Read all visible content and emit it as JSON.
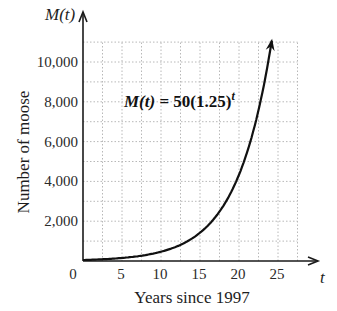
{
  "chart_data": {
    "type": "line",
    "title": "",
    "function_label": "M(t) = 50(1.25)^t",
    "equation": {
      "lhs": "M(t)",
      "eq": " = ",
      "coef": "50(1.25)",
      "exp": "t"
    },
    "xlabel": "Years since 1997",
    "ylabel": "Number of moose",
    "x_axis_symbol": "t",
    "y_axis_symbol": "M(t)",
    "xlim": [
      0,
      28
    ],
    "ylim": [
      0,
      11000
    ],
    "x_ticks": [
      0,
      5,
      10,
      15,
      20,
      25
    ],
    "x_tick_labels": [
      "0",
      "5",
      "10",
      "15",
      "20",
      "25"
    ],
    "y_ticks": [
      2000,
      4000,
      6000,
      8000,
      10000
    ],
    "y_tick_labels": [
      "2,000",
      "4,000",
      "6,000",
      "8,000",
      "10,000"
    ],
    "grid": true,
    "grid_style": "dotted",
    "grid_x_step": 2.5,
    "grid_y_step": 1000,
    "series": [
      {
        "name": "M(t) = 50(1.25)^t",
        "x": [
          0,
          2,
          4,
          6,
          8,
          10,
          12,
          14,
          16,
          18,
          20,
          22,
          24
        ],
        "values": [
          50,
          78,
          122,
          191,
          298,
          466,
          728,
          1137,
          1776,
          2776,
          4337,
          6776,
          10588
        ]
      }
    ],
    "curve_end_t": 24.2
  }
}
